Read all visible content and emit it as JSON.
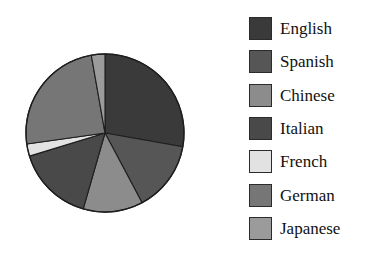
{
  "chart_data": {
    "type": "pie",
    "title": "",
    "xlabel": "",
    "ylabel": "",
    "legend_position": "right",
    "grid": false,
    "categories": [
      "English",
      "Spanish",
      "Chinese",
      "Italian",
      "French",
      "German",
      "Japanese"
    ],
    "values": [
      27.8,
      14.4,
      12.2,
      15.8,
      2.5,
      24.4,
      2.9
    ],
    "colors": [
      "#3a3a3a",
      "#565656",
      "#8c8c8c",
      "#494949",
      "#e2e2e2",
      "#767676",
      "#9b9b9b"
    ],
    "start_angle_deg": 0,
    "direction": "clockwise",
    "slices": [
      {
        "label": "English",
        "value": 27.8,
        "color": "#3a3a3a",
        "start_deg": 0.0,
        "end_deg": 100.0
      },
      {
        "label": "Spanish",
        "value": 14.4,
        "color": "#565656",
        "start_deg": 100.0,
        "end_deg": 152.0
      },
      {
        "label": "Chinese",
        "value": 12.2,
        "color": "#8c8c8c",
        "start_deg": 152.0,
        "end_deg": 196.0
      },
      {
        "label": "Italian",
        "value": 15.8,
        "color": "#494949",
        "start_deg": 196.0,
        "end_deg": 253.0
      },
      {
        "label": "French",
        "value": 2.5,
        "color": "#e2e2e2",
        "start_deg": 253.0,
        "end_deg": 262.0
      },
      {
        "label": "German",
        "value": 24.4,
        "color": "#767676",
        "start_deg": 262.0,
        "end_deg": 350.0
      },
      {
        "label": "Japanese",
        "value": 2.9,
        "color": "#9b9b9b",
        "start_deg": 350.0,
        "end_deg": 360.0
      }
    ],
    "outline_color": "#1e1e1e"
  },
  "legend": {
    "items": [
      {
        "label": "English",
        "color": "#3a3a3a"
      },
      {
        "label": "Spanish",
        "color": "#565656"
      },
      {
        "label": "Chinese",
        "color": "#8c8c8c"
      },
      {
        "label": "Italian",
        "color": "#494949"
      },
      {
        "label": "French",
        "color": "#e2e2e2"
      },
      {
        "label": "German",
        "color": "#767676"
      },
      {
        "label": "Japanese",
        "color": "#9b9b9b"
      }
    ]
  }
}
